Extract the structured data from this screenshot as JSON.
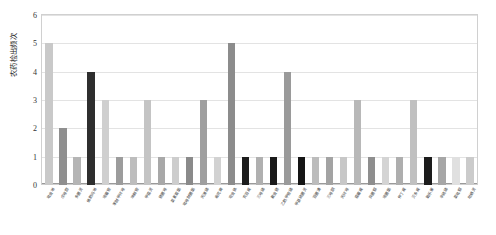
{
  "chart_data": {
    "type": "bar",
    "title": "",
    "xlabel": "",
    "ylabel": "农药检出频次",
    "ylim": [
      0,
      6
    ],
    "ytick_labels": [
      "0",
      "1",
      "2",
      "3",
      "4",
      "5",
      "6"
    ],
    "ytick_values": [
      0,
      1,
      2,
      3,
      4,
      5,
      6
    ],
    "grid": true,
    "legend": "none",
    "categories": [
      "吡虫啉",
      "戊唑醇",
      "多菌灵",
      "烯酰吗啉",
      "嘧霉胺",
      "苯醚甲环唑",
      "咪鲜胺",
      "甲霜灵",
      "腈菌唑",
      "氯氰菊酯",
      "吡唑醚菌酯",
      "丙溴磷",
      "毒死蜱",
      "啶虫脒",
      "克百威",
      "三唑磷",
      "氟虫腈",
      "乙酰甲胺磷",
      "甲基硫菌灵",
      "百菌清",
      "三唑酮",
      "丙环唑",
      "霜霉威",
      "异菌脲",
      "嘧菌酯",
      "仲丁威",
      "灭多威",
      "氧乐果",
      "辛硫磷",
      "氯吡脲",
      "哒螨灵"
    ],
    "values": [
      5,
      2,
      1,
      4,
      3,
      1,
      1,
      3,
      1,
      1,
      1,
      3,
      1,
      5,
      1,
      1,
      1,
      4,
      1,
      1,
      1,
      1,
      3,
      1,
      1,
      1,
      3,
      1,
      1,
      1,
      1
    ],
    "bar_colors": [
      "#c9c9c9",
      "#8f8f8f",
      "#b5b5b5",
      "#2e2e2e",
      "#cfcfcf",
      "#9c9c9c",
      "#bdbdbd",
      "#c4c4c4",
      "#a8a8a8",
      "#cdcdcd",
      "#8a8a8a",
      "#9f9f9f",
      "#d2d2d2",
      "#8c8c8c",
      "#1d1d1d",
      "#b0b0b0",
      "#1a1a1a",
      "#9a9a9a",
      "#151515",
      "#bcbcbc",
      "#a3a3a3",
      "#c7c7c7",
      "#b8b8b8",
      "#8e8e8e",
      "#d4d4d4",
      "#aeaeae",
      "#c0c0c0",
      "#1c1c1c",
      "#a6a6a6",
      "#e0e0e0",
      "#cbcbcb"
    ]
  }
}
